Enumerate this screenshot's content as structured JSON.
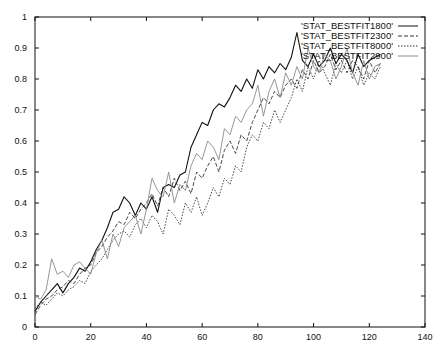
{
  "chart_data": {
    "type": "line",
    "title": "",
    "xlabel": "",
    "ylabel": "",
    "xlim": [
      0,
      140
    ],
    "ylim": [
      0,
      1
    ],
    "x_ticks": [
      "0",
      "20",
      "40",
      "60",
      "80",
      "100",
      "120",
      "140"
    ],
    "y_ticks": [
      "0",
      "0.1",
      "0.2",
      "0.3",
      "0.4",
      "0.5",
      "0.6",
      "0.7",
      "0.8",
      "0.9",
      "1"
    ],
    "grid": false,
    "legend_position": "top-right",
    "series": [
      {
        "name": "'STAT_BESTFIT1800'",
        "style": "solid",
        "color": "#111111",
        "x": [
          0,
          2,
          4,
          6,
          8,
          10,
          12,
          14,
          16,
          18,
          20,
          22,
          24,
          26,
          28,
          30,
          32,
          34,
          36,
          38,
          40,
          42,
          44,
          46,
          48,
          50,
          52,
          54,
          56,
          58,
          60,
          62,
          64,
          66,
          68,
          70,
          72,
          74,
          76,
          78,
          80,
          82,
          84,
          86,
          88,
          90,
          92,
          94,
          96,
          98,
          100,
          102,
          104,
          106,
          108,
          110,
          112,
          114,
          116,
          118,
          120,
          122,
          124
        ],
        "values": [
          0.05,
          0.08,
          0.1,
          0.12,
          0.14,
          0.11,
          0.14,
          0.16,
          0.19,
          0.18,
          0.21,
          0.25,
          0.28,
          0.32,
          0.37,
          0.38,
          0.42,
          0.4,
          0.36,
          0.4,
          0.38,
          0.42,
          0.37,
          0.45,
          0.46,
          0.45,
          0.49,
          0.5,
          0.58,
          0.62,
          0.66,
          0.65,
          0.7,
          0.72,
          0.71,
          0.74,
          0.78,
          0.76,
          0.8,
          0.77,
          0.83,
          0.8,
          0.84,
          0.82,
          0.85,
          0.83,
          0.87,
          0.95,
          0.86,
          0.84,
          0.88,
          0.84,
          0.86,
          0.9,
          0.85,
          0.88,
          0.86,
          0.82,
          0.88,
          0.84,
          0.86,
          0.87,
          0.88
        ]
      },
      {
        "name": "'STAT_BESTFIT2300'",
        "style": "dashed",
        "color": "#333333",
        "x": [
          0,
          2,
          4,
          6,
          8,
          10,
          12,
          14,
          16,
          18,
          20,
          22,
          24,
          26,
          28,
          30,
          32,
          34,
          36,
          38,
          40,
          42,
          44,
          46,
          48,
          50,
          52,
          54,
          56,
          58,
          60,
          62,
          64,
          66,
          68,
          70,
          72,
          74,
          76,
          78,
          80,
          82,
          84,
          86,
          88,
          90,
          92,
          94,
          96,
          98,
          100,
          102,
          104,
          106,
          108,
          110,
          112,
          114,
          116,
          118,
          120,
          122,
          124
        ],
        "values": [
          0.04,
          0.07,
          0.09,
          0.1,
          0.12,
          0.13,
          0.15,
          0.14,
          0.17,
          0.19,
          0.2,
          0.24,
          0.26,
          0.29,
          0.31,
          0.34,
          0.33,
          0.37,
          0.35,
          0.38,
          0.4,
          0.43,
          0.39,
          0.45,
          0.42,
          0.48,
          0.44,
          0.47,
          0.43,
          0.5,
          0.48,
          0.52,
          0.55,
          0.5,
          0.57,
          0.6,
          0.56,
          0.62,
          0.6,
          0.66,
          0.7,
          0.74,
          0.72,
          0.76,
          0.74,
          0.78,
          0.8,
          0.77,
          0.83,
          0.8,
          0.86,
          0.82,
          0.84,
          0.88,
          0.83,
          0.86,
          0.82,
          0.86,
          0.84,
          0.8,
          0.86,
          0.82,
          0.85
        ]
      },
      {
        "name": "'STAT_BESTFIT8000'",
        "style": "dotted",
        "color": "#333333",
        "x": [
          0,
          2,
          4,
          6,
          8,
          10,
          12,
          14,
          16,
          18,
          20,
          22,
          24,
          26,
          28,
          30,
          32,
          34,
          36,
          38,
          40,
          42,
          44,
          46,
          48,
          50,
          52,
          54,
          56,
          58,
          60,
          62,
          64,
          66,
          68,
          70,
          72,
          74,
          76,
          78,
          80,
          82,
          84,
          86,
          88,
          90,
          92,
          94,
          96,
          98,
          100,
          102,
          104,
          106,
          108,
          110,
          112,
          114,
          116,
          118,
          120,
          122,
          124
        ],
        "values": [
          0.06,
          0.08,
          0.07,
          0.09,
          0.11,
          0.1,
          0.12,
          0.13,
          0.15,
          0.14,
          0.18,
          0.2,
          0.22,
          0.25,
          0.28,
          0.3,
          0.31,
          0.29,
          0.33,
          0.35,
          0.32,
          0.36,
          0.34,
          0.3,
          0.38,
          0.36,
          0.33,
          0.4,
          0.37,
          0.42,
          0.36,
          0.4,
          0.45,
          0.42,
          0.48,
          0.46,
          0.52,
          0.5,
          0.58,
          0.62,
          0.6,
          0.66,
          0.64,
          0.7,
          0.66,
          0.7,
          0.74,
          0.8,
          0.76,
          0.84,
          0.8,
          0.86,
          0.82,
          0.78,
          0.85,
          0.82,
          0.86,
          0.8,
          0.84,
          0.78,
          0.82,
          0.8,
          0.84
        ]
      },
      {
        "name": "'STAT_BESTFIT2900'",
        "style": "solid",
        "color": "#8a8a8a",
        "x": [
          0,
          2,
          4,
          6,
          8,
          10,
          12,
          14,
          16,
          18,
          20,
          22,
          24,
          26,
          28,
          30,
          32,
          34,
          36,
          38,
          40,
          42,
          44,
          46,
          48,
          50,
          52,
          54,
          56,
          58,
          60,
          62,
          64,
          66,
          68,
          70,
          72,
          74,
          76,
          78,
          80,
          82,
          84,
          86,
          88,
          90,
          92,
          94,
          96,
          98,
          100,
          102,
          104,
          106,
          108,
          110,
          112,
          114,
          116,
          118,
          120,
          122,
          124
        ],
        "values": [
          0.1,
          0.09,
          0.12,
          0.22,
          0.17,
          0.18,
          0.16,
          0.2,
          0.21,
          0.19,
          0.17,
          0.24,
          0.28,
          0.22,
          0.3,
          0.26,
          0.32,
          0.34,
          0.36,
          0.3,
          0.38,
          0.48,
          0.44,
          0.42,
          0.5,
          0.4,
          0.46,
          0.44,
          0.52,
          0.56,
          0.54,
          0.6,
          0.58,
          0.54,
          0.64,
          0.62,
          0.68,
          0.66,
          0.7,
          0.72,
          0.78,
          0.68,
          0.76,
          0.8,
          0.74,
          0.82,
          0.78,
          0.84,
          0.8,
          0.9,
          0.84,
          0.82,
          0.88,
          0.86,
          0.8,
          0.84,
          0.9,
          0.82,
          0.78,
          0.86,
          0.8,
          0.84,
          0.85
        ]
      }
    ]
  }
}
